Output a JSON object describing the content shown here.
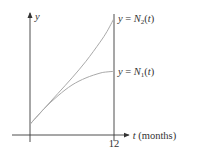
{
  "chart_data": {
    "type": "line",
    "title": "",
    "xlabel": "t (months)",
    "ylabel": "y",
    "xlabel_var": "t",
    "xlabel_unit": "(months)",
    "xlim": [
      0,
      14.2
    ],
    "ylim": [
      0,
      1.0
    ],
    "grid": false,
    "legend": "none",
    "x_ticks": [
      {
        "value": 12,
        "label": "12"
      }
    ],
    "reference_lines": [
      {
        "orientation": "vertical",
        "x": 12
      }
    ],
    "series": [
      {
        "name": "N2",
        "label_prefix": "y = N",
        "label_sub": "2",
        "label_suffix": "(t)",
        "color": "#a9a9a9",
        "x": [
          0,
          2,
          4,
          6,
          8,
          10,
          11,
          12
        ],
        "values": [
          0.09,
          0.22,
          0.35,
          0.48,
          0.62,
          0.78,
          0.87,
          0.98
        ]
      },
      {
        "name": "N1",
        "label_prefix": "y = N",
        "label_sub": "1",
        "label_suffix": "(t)",
        "color": "#a9a9a9",
        "x": [
          0,
          2,
          4,
          6,
          8,
          10,
          11,
          12
        ],
        "values": [
          0.09,
          0.22,
          0.33,
          0.42,
          0.48,
          0.52,
          0.53,
          0.535
        ]
      }
    ]
  }
}
